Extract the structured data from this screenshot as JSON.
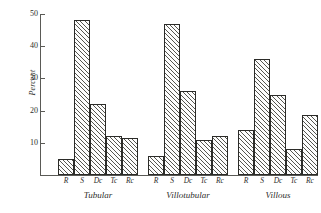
{
  "chart_data": {
    "type": "bar",
    "title": "",
    "xlabel": "",
    "ylabel": "Percent",
    "ylim": [
      0,
      50
    ],
    "yticks": [
      10,
      20,
      30,
      40,
      50
    ],
    "grid": false,
    "legend": false,
    "categories": [
      "R",
      "S",
      "Dc",
      "Tc",
      "Rc"
    ],
    "groups": [
      {
        "name": "Tubular",
        "categories": [
          "R",
          "S",
          "Dc",
          "Tc",
          "Rc"
        ],
        "values": [
          5,
          48,
          22,
          12,
          11.5
        ]
      },
      {
        "name": "Villotubular",
        "categories": [
          "R",
          "S",
          "Dc",
          "Tc",
          "Rc"
        ],
        "values": [
          6,
          47,
          26,
          11,
          12
        ]
      },
      {
        "name": "Villous",
        "categories": [
          "R",
          "S",
          "Dc",
          "Tc",
          "Rc"
        ],
        "values": [
          14,
          36,
          25,
          8,
          18.5
        ]
      }
    ]
  },
  "axis": {
    "y_label": "Percent",
    "y_tick_labels": [
      "10",
      "20",
      "30",
      "40",
      "50"
    ]
  }
}
